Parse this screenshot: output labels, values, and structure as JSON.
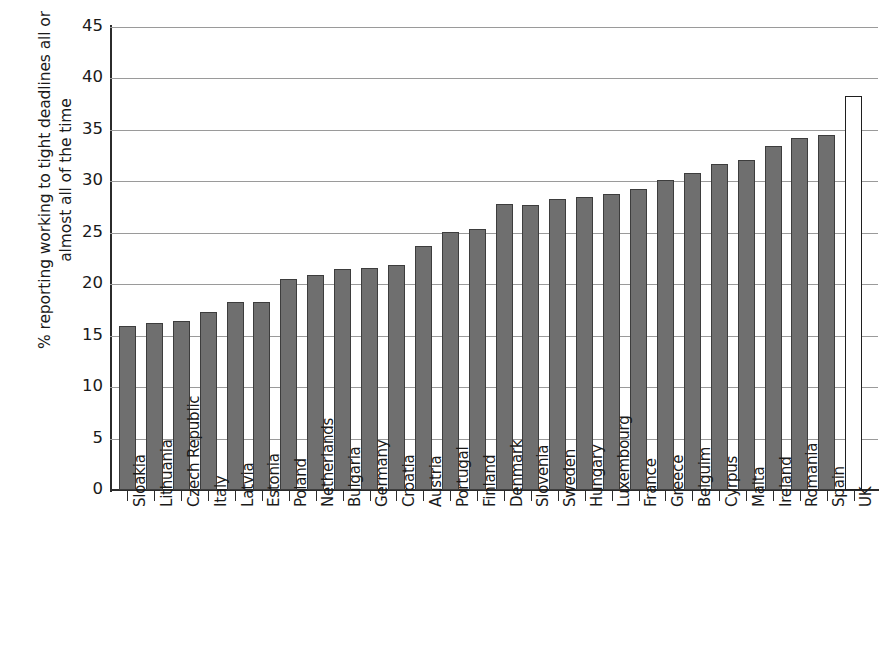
{
  "chart_data": {
    "type": "bar",
    "title": "",
    "subtitle": "",
    "xlabel": "",
    "ylabel": "% reporting working to tight deadlines all or\nalmost all of the time",
    "ylim": [
      0,
      45
    ],
    "ytick_step": 5,
    "ytick_labels": [
      "45",
      "40",
      "35",
      "30",
      "25",
      "20",
      "15",
      "10",
      "5",
      "0"
    ],
    "ytick_values": [
      45,
      40,
      35,
      30,
      25,
      20,
      15,
      10,
      5,
      0
    ],
    "grid": "horizontal",
    "legend": "none",
    "categories": [
      "Sloakia",
      "Lithuania",
      "Czech Republic",
      "Italy",
      "Latvia",
      "Estonia",
      "Poland",
      "Netherlands",
      "Bulgaria",
      "Germany",
      "Croatia",
      "Austria",
      "Portugal",
      "Finland",
      "Denmark",
      "Slovenia",
      "Sweden",
      "Hungary",
      "Luxembourg",
      "France",
      "Greece",
      "Belguim",
      "Cyrpus",
      "Malta",
      "Ireland",
      "Romania",
      "Spain",
      "UK"
    ],
    "values": [
      15.9,
      16.2,
      16.4,
      17.3,
      18.3,
      18.3,
      20.5,
      20.9,
      21.5,
      21.6,
      21.9,
      23.7,
      25.1,
      25.4,
      27.8,
      27.7,
      28.3,
      28.5,
      28.8,
      29.3,
      30.1,
      30.8,
      31.7,
      32.1,
      33.4,
      34.2,
      34.5,
      38.3
    ],
    "highlight_category": "UK",
    "bar_color": "#6f6f6f",
    "highlight_bar_color": "#ffffff",
    "bar_edge_color": "#3d3d3d",
    "gridline_color": "#9a9a9a",
    "axis_color": "#2b2b2b",
    "background_color": "#ffffff"
  }
}
